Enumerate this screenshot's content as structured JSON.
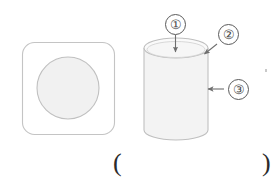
{
  "figure": {
    "title_present": false,
    "background_color": "#ffffff",
    "stroke_color": "#bdbdbd",
    "fill_color": "#f2f2f2",
    "callout_stroke_color": "#5a5a5a",
    "arrow_color": "#6e6e6e",
    "shapes": [
      {
        "name": "rounded-square-with-inscribed-circle",
        "description": "rounded square outline containing a shaded circle",
        "x": 22,
        "y": 42,
        "width": 92,
        "height": 92,
        "corner_radius": 12,
        "circle_center_x": 68,
        "circle_center_y": 88,
        "circle_radius": 31
      },
      {
        "name": "cylinder",
        "description": "three dimensional cylinder drawn in perspective",
        "left": 144,
        "right": 207,
        "top_ellipse_center_y": 48,
        "bottom_ellipse_center_y": 130,
        "ellipse_radius_x": 32,
        "ellipse_radius_y": 10
      }
    ]
  },
  "callouts": [
    {
      "id": "callout-1",
      "label": "①",
      "number": 1,
      "points_to": "top-circular-face",
      "arrow_direction": "down"
    },
    {
      "id": "callout-2",
      "label": "②",
      "number": 2,
      "points_to": "top-rim-edge",
      "arrow_direction": "down-left"
    },
    {
      "id": "callout-3",
      "label": "③",
      "number": 3,
      "points_to": "lateral-surface",
      "arrow_direction": "left"
    }
  ],
  "answer_field": {
    "open_paren": "(",
    "close_paren": ")",
    "value": "",
    "placeholder": ""
  }
}
